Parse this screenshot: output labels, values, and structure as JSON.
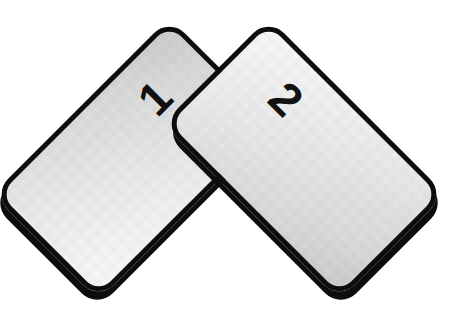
{
  "scene": {
    "title": "Two overlapping tilted cards",
    "background_color": "#ffffff",
    "width": 470,
    "height": 325
  },
  "cards": [
    {
      "id": "card-1",
      "label": "1",
      "position": "left",
      "rotation_deg": 45,
      "stack_order": "behind",
      "border_color": "#0d0d0d",
      "fill_gradient_from": "#cfcfcf",
      "fill_gradient_to": "#fdfdfd",
      "label_color": "#111111"
    },
    {
      "id": "card-2",
      "label": "2",
      "position": "right",
      "rotation_deg": -45,
      "stack_order": "front",
      "border_color": "#0d0d0d",
      "fill_gradient_from": "#cfcfcf",
      "fill_gradient_to": "#fdfdfd",
      "label_color": "#111111"
    }
  ]
}
